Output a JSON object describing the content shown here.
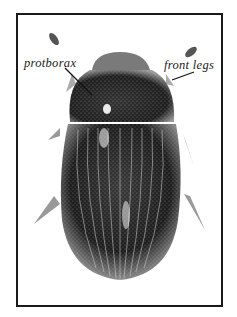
{
  "figure": {
    "labels": [
      {
        "text": "protborax",
        "x": 24,
        "y": 56
      },
      {
        "text": "front legs",
        "x": 164,
        "y": 58
      }
    ]
  }
}
